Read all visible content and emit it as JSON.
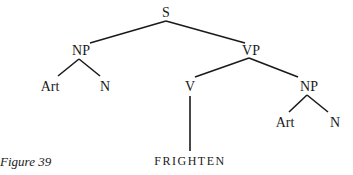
{
  "caption": "Figure 39",
  "tree": {
    "nodes": {
      "s": "S",
      "np1": "NP",
      "vp": "VP",
      "art1": "Art",
      "n1": "N",
      "v": "V",
      "np2": "NP",
      "art2": "Art",
      "n2": "N",
      "frighten": "FRIGHTEN"
    },
    "edges": [
      [
        "S",
        "NP"
      ],
      [
        "S",
        "VP"
      ],
      [
        "NP",
        "Art"
      ],
      [
        "NP",
        "N"
      ],
      [
        "VP",
        "V"
      ],
      [
        "VP",
        "NP"
      ],
      [
        "V",
        "FRIGHTEN"
      ],
      [
        "NP",
        "Art"
      ],
      [
        "NP",
        "N"
      ]
    ]
  }
}
